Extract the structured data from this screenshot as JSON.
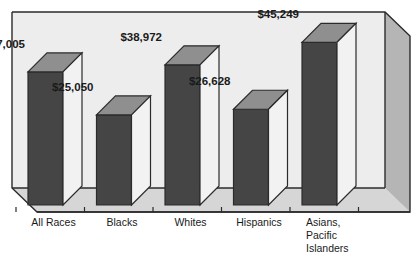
{
  "chart_data": {
    "type": "bar",
    "title": "",
    "subtitle": "",
    "xlabel": "",
    "ylabel": "",
    "grid": false,
    "legend": "none",
    "style": "3d-column",
    "ylim": [
      0,
      52000
    ],
    "categories": [
      "All Races",
      "Blacks",
      "Whites",
      "Hispanics",
      "Asians, Pacific Islanders"
    ],
    "category_lines": [
      [
        "All Races"
      ],
      [
        "Blacks"
      ],
      [
        "Whites"
      ],
      [
        "Hispanics"
      ],
      [
        "Asians,",
        "Pacific",
        "Islanders"
      ]
    ],
    "values": [
      37005,
      25050,
      38972,
      26628,
      45249
    ],
    "data_labels": [
      "$37,005",
      "$25,050",
      "$38,972",
      "$26,628",
      "$45,249"
    ]
  },
  "colors": {
    "bar_front": "#454545",
    "bar_top": "#8f8f8f",
    "bar_side": "#f2f2f2",
    "plot_background": "#ededed",
    "back_wall": "#ededed",
    "floor": "#d6d6d6",
    "right_wall": "#b5b5b5",
    "outline": "#2b2b2b",
    "axis_line": "#2b2b2b",
    "label_text": "#1a1a1a"
  }
}
